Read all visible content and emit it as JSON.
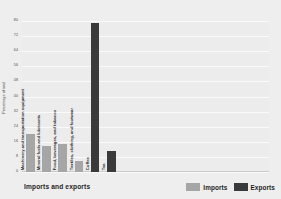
{
  "chart_data": {
    "type": "bar",
    "title": "",
    "xlabel": "Imports and exports",
    "ylabel": "Percentage of total",
    "ylim": [
      0,
      80
    ],
    "ytick_step": 8,
    "yticks": [
      80,
      72,
      64,
      56,
      48,
      40,
      32,
      24,
      16,
      8,
      0
    ],
    "grid": true,
    "legend_position": "bottom-right",
    "categories": [
      "Machinery and transportation equipment",
      "Mineral fuels and lubricants",
      "Food, beverages, and tobacco",
      "Textiles, clothing, and footwear",
      "Coffee",
      "Tea"
    ],
    "series": [
      {
        "name": "Imports",
        "color": "#a6a6a6",
        "values": [
          20,
          14,
          15,
          6,
          null,
          null
        ]
      },
      {
        "name": "Exports",
        "color": "#3a3a3a",
        "values": [
          null,
          null,
          null,
          null,
          79,
          11
        ]
      }
    ]
  },
  "legend": {
    "items": [
      {
        "label": "Imports",
        "color": "#a6a6a6"
      },
      {
        "label": "Exports",
        "color": "#3a3a3a"
      }
    ]
  },
  "colors": {
    "background": "#eeeeee",
    "plot_background": "#ececec",
    "gridline": "#fafafa",
    "imports": "#a6a6a6",
    "exports": "#3a3a3a",
    "text": "#1f1f1f"
  }
}
